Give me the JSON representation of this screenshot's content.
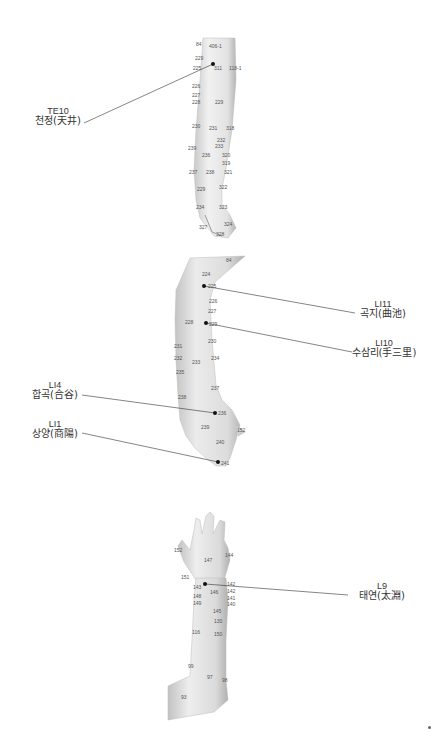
{
  "figures": [
    {
      "id": "arm-posterior",
      "point_labels": [
        "84",
        "406-1",
        "229",
        "225",
        "311",
        "118-1",
        "226",
        "227",
        "228",
        "229",
        "230",
        "231",
        "318",
        "232",
        "233",
        "239",
        "236",
        "320",
        "319",
        "237",
        "238",
        "321",
        "322",
        "323",
        "229",
        "234",
        "324",
        "327",
        "328"
      ],
      "callouts": [
        {
          "code": "TE10",
          "name": "천정(天井)"
        }
      ]
    },
    {
      "id": "arm-lateral",
      "point_labels": [
        "84",
        "224",
        "225",
        "226",
        "227",
        "229",
        "228",
        "230",
        "231",
        "232",
        "233",
        "234",
        "235",
        "237",
        "236",
        "238",
        "239",
        "240",
        "241",
        "152"
      ],
      "callouts": [
        {
          "code": "LI11",
          "name": "곡지(曲池)"
        },
        {
          "code": "LI10",
          "name": "수삼리(手三里)"
        },
        {
          "code": "LI4",
          "name": "합곡(合谷)"
        },
        {
          "code": "LI1",
          "name": "상양(商陽)"
        }
      ]
    },
    {
      "id": "arm-anterior",
      "point_labels": [
        "152",
        "144",
        "147",
        "151",
        "142",
        "143",
        "146",
        "142",
        "148",
        "141",
        "149",
        "140",
        "145",
        "130",
        "116",
        "150",
        "99",
        "97",
        "98",
        "93"
      ],
      "callouts": [
        {
          "code": "L9",
          "name": "태연(太淵)"
        }
      ]
    }
  ],
  "colors": {
    "skin_light": "#f2f2f2",
    "skin_mid": "#d6d6d6",
    "skin_dark": "#a8a8a8",
    "leader_line": "#333333",
    "point_dot": "#111111",
    "label_text": "#555555"
  }
}
